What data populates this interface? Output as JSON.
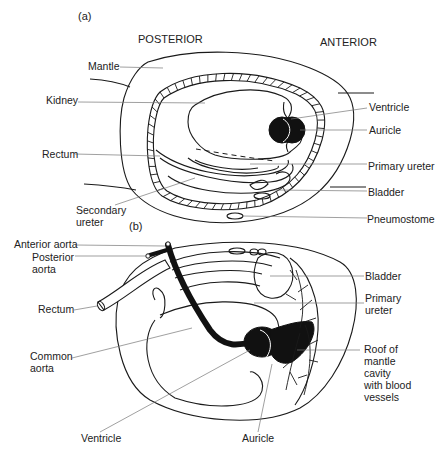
{
  "figure": {
    "panel_a": {
      "tag": "(a)",
      "orientation": {
        "left": "POSTERIOR",
        "right": "ANTERIOR"
      },
      "labels": {
        "mantle": "Mantle",
        "kidney": "Kidney",
        "rectum": "Rectum",
        "secondary_ureter_1": "Secondary",
        "secondary_ureter_2": "ureter",
        "ventricle": "Ventricle",
        "auricle": "Auricle",
        "primary_ureter": "Primary ureter",
        "bladder": "Bladder",
        "pneumostome": "Pneumostome"
      }
    },
    "panel_b": {
      "tag": "(b)",
      "labels": {
        "anterior_aorta": "Anterior aorta",
        "posterior_aorta_1": "Posterior",
        "posterior_aorta_2": "aorta",
        "rectum": "Rectum",
        "common_aorta_1": "Common",
        "common_aorta_2": "aorta",
        "ventricle": "Ventricle",
        "bladder": "Bladder",
        "primary_ureter_1": "Primary",
        "primary_ureter_2": "ureter",
        "roof_1": "Roof of",
        "roof_2": "mantle",
        "roof_3": "cavity",
        "roof_4": "with blood",
        "roof_5": "vessels",
        "auricle": "Auricle"
      }
    }
  }
}
